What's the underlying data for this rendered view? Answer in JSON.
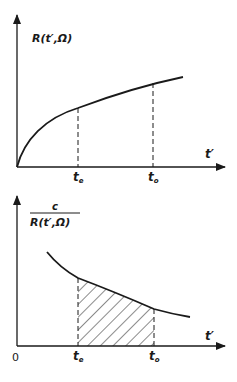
{
  "figure": {
    "panels": [
      {
        "id": "top",
        "y_label": "R(t′,Ω)",
        "x_label": "t′",
        "ticks": [
          {
            "label_main": "t",
            "label_sub": "e"
          },
          {
            "label_main": "t",
            "label_sub": "o"
          }
        ],
        "description": "Increasing concave curve R(t',Ω) starting at origin, dashed verticals at t_e and t_o"
      },
      {
        "id": "bottom",
        "y_label_numerator": "c",
        "y_label_denominator": "R(t′,Ω)",
        "x_label": "t′",
        "origin_label": "0",
        "ticks": [
          {
            "label_main": "t",
            "label_sub": "e"
          },
          {
            "label_main": "t",
            "label_sub": "o"
          }
        ],
        "description": "Decreasing convex curve c/R(t',Ω) with hatched area between t_e and t_o"
      }
    ],
    "colors": {
      "ink": "#1a1a1a",
      "background": "#ffffff"
    }
  }
}
